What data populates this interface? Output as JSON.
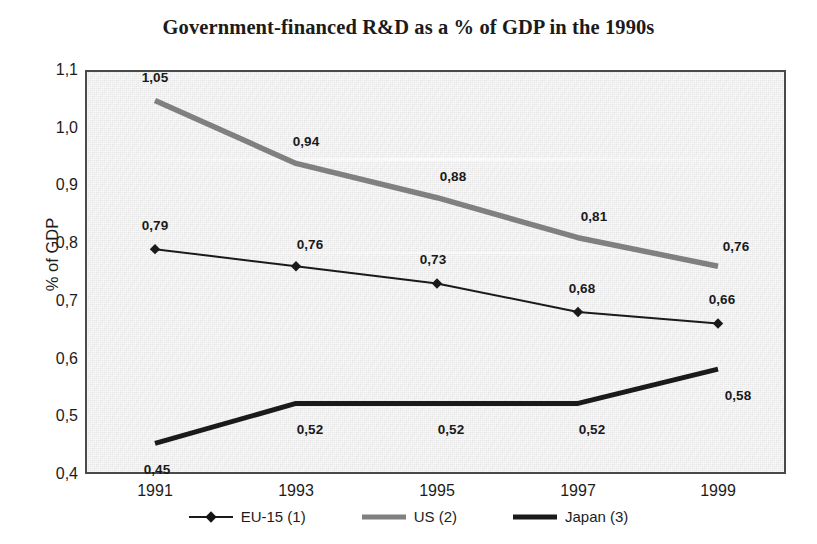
{
  "chart_data": {
    "type": "line",
    "title": "Government-financed R&D as a % of GDP in the 1990s",
    "xlabel": "",
    "ylabel": "% of GDP",
    "categories": [
      "1991",
      "1993",
      "1995",
      "1997",
      "1999"
    ],
    "x_tick_labels": [
      "1991",
      "1993",
      "1995",
      "1997",
      "1999"
    ],
    "y_tick_labels": [
      "1,1",
      "1,0",
      "0,9",
      "0,8",
      "0,7",
      "0,6",
      "0,5",
      "0,4"
    ],
    "y_tick_values": [
      1.1,
      1.0,
      0.9,
      0.8,
      0.7,
      0.6,
      0.5,
      0.4
    ],
    "ylim": [
      0.4,
      1.1
    ],
    "grid": false,
    "legend_position": "bottom",
    "decimal_separator": ",",
    "series": [
      {
        "name": "EU-15 (1)",
        "legend_label": "EU-15 (1)",
        "marker": "diamond",
        "color": "#1a1a1a",
        "line_width": 2,
        "values": [
          0.79,
          0.76,
          0.73,
          0.68,
          0.66
        ],
        "data_labels": [
          "0,79",
          "0,76",
          "0,73",
          "0,68",
          "0,66"
        ]
      },
      {
        "name": "US (2)",
        "legend_label": "US (2)",
        "marker": "none",
        "color": "#808080",
        "line_width": 5,
        "values": [
          1.05,
          0.94,
          0.88,
          0.81,
          0.76
        ],
        "data_labels": [
          "1,05",
          "0,94",
          "0,88",
          "0,81",
          "0,76"
        ]
      },
      {
        "name": "Japan (3)",
        "legend_label": "Japan (3)",
        "marker": "none",
        "color": "#1a1a1a",
        "line_width": 5,
        "values": [
          0.45,
          0.52,
          0.52,
          0.52,
          0.58
        ],
        "data_labels": [
          "0,45",
          "0,52",
          "0,52",
          "0,52",
          "0,58"
        ]
      }
    ]
  },
  "colors": {
    "plot_background": "#e9e9e9",
    "page_background": "#ffffff",
    "axis_border": "#4a4a4a",
    "text": "#1c1c1c",
    "us_series": "#808080",
    "eu_series": "#1a1a1a",
    "japan_series": "#1a1a1a"
  }
}
